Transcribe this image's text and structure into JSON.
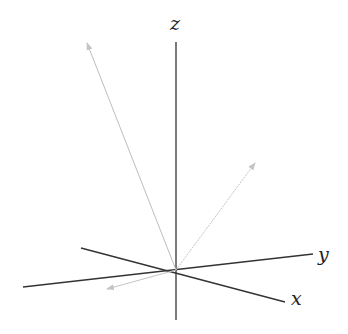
{
  "diagram": {
    "axes": {
      "x": {
        "label": "x"
      },
      "y": {
        "label": "y"
      },
      "z": {
        "label": "z"
      }
    },
    "vectors": [
      {
        "name": "vector-up-left",
        "color": "#b8b8b8"
      },
      {
        "name": "vector-up-right",
        "color": "#c0c0c0"
      },
      {
        "name": "vector-down-left",
        "color": "#c0c0c0"
      }
    ],
    "colors": {
      "axis": "#333333",
      "vector": "#bbbbbb"
    }
  }
}
